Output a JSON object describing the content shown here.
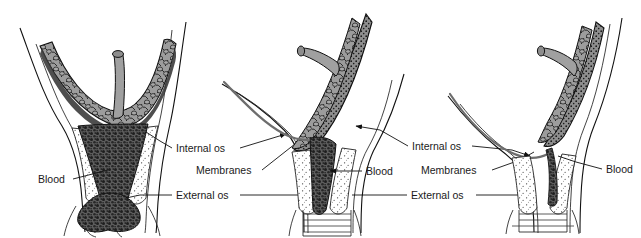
{
  "figure": {
    "background_color": "#ffffff",
    "ink_color": "#111111",
    "tissue_fill": "#9a9a9a",
    "membrane_color": "#6d6d6d",
    "blood_color": "#3a3a3a",
    "panel_count": 3
  },
  "panels": [
    {
      "id": "panel-1",
      "name": "panel-left",
      "description": "Placenta completely covering the internal os with heavy dark blood filling the cervical canal and escaping through the external os",
      "labels": [
        {
          "id": "p1-blood",
          "text": "Blood",
          "x": 38,
          "y": 183,
          "anchor": "start"
        }
      ]
    },
    {
      "id": "panel-2",
      "name": "panel-middle",
      "description": "Placenta partially covering the internal os, membranes visible, blood tracking down the cervical canal into the vagina",
      "labels": [
        {
          "id": "p2-blood",
          "text": "Blood",
          "x": 366,
          "y": 175,
          "anchor": "start"
        }
      ]
    },
    {
      "id": "panel-3",
      "name": "panel-right",
      "description": "Low-lying placenta clear of the internal os, membranes intact across the os, small amount of blood at the margin",
      "labels": [
        {
          "id": "p3-blood",
          "text": "Blood",
          "x": 606,
          "y": 173,
          "anchor": "start"
        }
      ]
    }
  ],
  "label_groups": [
    {
      "id": "label-group-left",
      "name": "label-group-between-panel-1-and-2",
      "items": [
        {
          "id": "lg1-internal-os",
          "text": "Internal os",
          "x": 176,
          "y": 152
        },
        {
          "id": "lg1-membranes",
          "text": "Membranes",
          "x": 196,
          "y": 174
        },
        {
          "id": "lg1-external-os",
          "text": "External os",
          "x": 176,
          "y": 199
        }
      ]
    },
    {
      "id": "label-group-right",
      "name": "label-group-between-panel-2-and-3",
      "items": [
        {
          "id": "lg2-internal-os",
          "text": "Internal os",
          "x": 412,
          "y": 150
        },
        {
          "id": "lg2-membranes",
          "text": "Membranes",
          "x": 421,
          "y": 174
        },
        {
          "id": "lg2-external-os",
          "text": "External os",
          "x": 411,
          "y": 199
        }
      ]
    }
  ],
  "terms": {
    "internal_os": "Internal os",
    "external_os": "External os",
    "membranes": "Membranes",
    "blood": "Blood"
  }
}
